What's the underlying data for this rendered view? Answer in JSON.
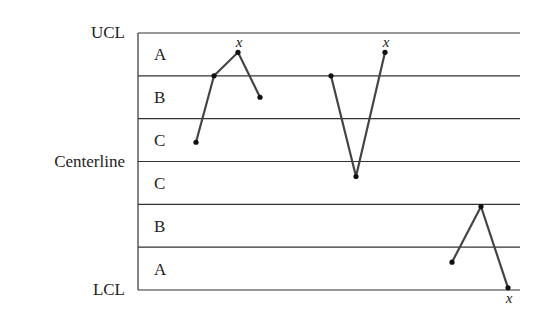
{
  "chart_data": {
    "type": "line",
    "title": "",
    "chart_kind": "control chart with zones",
    "limit_labels": {
      "ucl": "UCL",
      "centerline": "Centerline",
      "lcl": "LCL"
    },
    "zones_top_to_bottom": [
      "A",
      "B",
      "C",
      "C",
      "B",
      "A"
    ],
    "zone_boundaries_sigma": [
      3,
      2,
      1,
      0,
      -1,
      -2,
      -3
    ],
    "marker_label": "x",
    "series": [
      {
        "name": "run-1",
        "points": [
          {
            "x": 1,
            "sigma": 0.45
          },
          {
            "x": 2,
            "sigma": 2.0
          },
          {
            "x": 3,
            "sigma": 2.55,
            "flag": "x"
          },
          {
            "x": 4,
            "sigma": 1.5
          }
        ]
      },
      {
        "name": "run-2",
        "points": [
          {
            "x": 6,
            "sigma": 2.0
          },
          {
            "x": 7,
            "sigma": -0.35
          },
          {
            "x": 8,
            "sigma": 2.55,
            "flag": "x"
          }
        ]
      },
      {
        "name": "run-3",
        "points": [
          {
            "x": 11,
            "sigma": -2.35
          },
          {
            "x": 12,
            "sigma": -1.05
          },
          {
            "x": 13,
            "sigma": -2.95,
            "flag": "x"
          }
        ]
      }
    ],
    "xlabel": "",
    "ylabel": "",
    "grid": false,
    "legend": "none"
  },
  "colors": {
    "lines": "#333333",
    "series": "#444444",
    "text": "#222222"
  }
}
